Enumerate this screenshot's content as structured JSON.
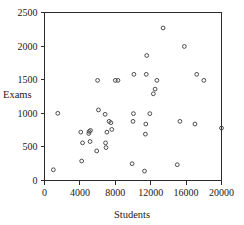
{
  "chart_data": {
    "type": "scatter",
    "title": "",
    "xlabel": "Students",
    "ylabel": "Exams",
    "xlim": [
      0,
      20000
    ],
    "ylim": [
      0,
      2500
    ],
    "grid": false,
    "legend": null,
    "xticks": [
      0,
      4000,
      8000,
      12000,
      16000,
      20000
    ],
    "xtick_labels": [
      "0",
      "4000",
      "8000",
      "12000",
      "16000",
      "20000"
    ],
    "yticks": [
      0,
      500,
      1000,
      1500,
      2000,
      2500
    ],
    "ytick_labels": [
      "0",
      "500",
      "1000",
      "1500",
      "2000",
      "2500"
    ],
    "marker": "open-circle",
    "marker_color": "#3a3a3a",
    "points": [
      {
        "x": 1000,
        "y": 160
      },
      {
        "x": 1500,
        "y": 1000
      },
      {
        "x": 4200,
        "y": 290
      },
      {
        "x": 4100,
        "y": 720
      },
      {
        "x": 4300,
        "y": 560
      },
      {
        "x": 5000,
        "y": 700
      },
      {
        "x": 5050,
        "y": 730
      },
      {
        "x": 5200,
        "y": 745
      },
      {
        "x": 5150,
        "y": 580
      },
      {
        "x": 5900,
        "y": 440
      },
      {
        "x": 6100,
        "y": 1050
      },
      {
        "x": 6000,
        "y": 1490
      },
      {
        "x": 6850,
        "y": 985
      },
      {
        "x": 6900,
        "y": 560
      },
      {
        "x": 6950,
        "y": 490
      },
      {
        "x": 7050,
        "y": 720
      },
      {
        "x": 7300,
        "y": 880
      },
      {
        "x": 7500,
        "y": 860
      },
      {
        "x": 7600,
        "y": 760
      },
      {
        "x": 8000,
        "y": 1490
      },
      {
        "x": 8300,
        "y": 1490
      },
      {
        "x": 9900,
        "y": 250
      },
      {
        "x": 10000,
        "y": 880
      },
      {
        "x": 10050,
        "y": 995
      },
      {
        "x": 10100,
        "y": 1580
      },
      {
        "x": 11300,
        "y": 140
      },
      {
        "x": 11400,
        "y": 690
      },
      {
        "x": 11450,
        "y": 840
      },
      {
        "x": 11500,
        "y": 1580
      },
      {
        "x": 11550,
        "y": 1860
      },
      {
        "x": 11900,
        "y": 995
      },
      {
        "x": 12300,
        "y": 1290
      },
      {
        "x": 12500,
        "y": 1360
      },
      {
        "x": 12700,
        "y": 1490
      },
      {
        "x": 13400,
        "y": 2270
      },
      {
        "x": 15000,
        "y": 235
      },
      {
        "x": 15300,
        "y": 880
      },
      {
        "x": 15800,
        "y": 1995
      },
      {
        "x": 17000,
        "y": 840
      },
      {
        "x": 17200,
        "y": 1580
      },
      {
        "x": 18000,
        "y": 1490
      },
      {
        "x": 20000,
        "y": 780
      }
    ]
  }
}
